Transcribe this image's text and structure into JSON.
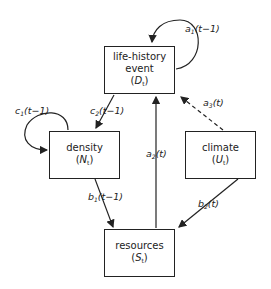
{
  "nodes": {
    "life_history": {
      "line1": "life-history",
      "line2": "event",
      "symbol": "D",
      "sub": "t"
    },
    "density": {
      "line1": "density",
      "symbol": "N",
      "sub": "t"
    },
    "climate": {
      "line1": "climate",
      "symbol": "U",
      "sub": "t"
    },
    "resources": {
      "line1": "resources",
      "symbol": "S",
      "sub": "t"
    }
  },
  "edges": {
    "a1": {
      "var": "a",
      "sub": "1",
      "arg": "(t−1)"
    },
    "a2": {
      "var": "a",
      "sub": "2",
      "arg": "(t)"
    },
    "a3": {
      "var": "a",
      "sub": "3",
      "arg": "(t)"
    },
    "b1": {
      "var": "b",
      "sub": "1",
      "arg": "(t−1)"
    },
    "b2": {
      "var": "b",
      "sub": "2",
      "arg": "(t)"
    },
    "c1": {
      "var": "c",
      "sub": "1",
      "arg": "(t−1)"
    },
    "c2": {
      "var": "c",
      "sub": "2",
      "arg": "(t−1)"
    }
  }
}
